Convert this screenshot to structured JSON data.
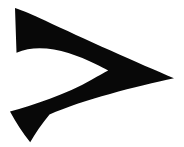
{
  "canvas": {
    "width": 184,
    "height": 147,
    "background_color": "#ffffff"
  },
  "figure": {
    "name": "chevron-right-glyph",
    "semantic": "greater-than-sign",
    "fill_color": "#080808",
    "stroke_color": "none",
    "view_box": "0 0 184 147",
    "path": "M 15.0 8.0 L 16.5 52.8 C 41.0 42.0 72.0 52.5 95.5 64.0 C 100.5 66.4 104.8 68.6 108.2 70.4 C 104.0 72.6 98.6 75.6 92.0 79.4 C 66.0 94.4 33.0 105.0 10.0 111.5 C 16.0 122.5 23.0 133.5 30.2 142.2 C 35.0 134.0 41.6 124.0 49.5 114.5 C 82.0 100.0 137.0 86.0 174.0 78.2 C 140.0 64.0 82.0 38.0 45.0 20.5 C 33.0 14.8 22.5 10.4 15.0 8.0 Z",
    "vertices": [
      {
        "label": "top-left-corner",
        "x": 15,
        "y": 8
      },
      {
        "label": "left-lower-corner",
        "x": 17,
        "y": 53
      },
      {
        "label": "inner-notch-apex",
        "x": 108,
        "y": 70
      },
      {
        "label": "bottom-left-corner",
        "x": 10,
        "y": 112
      },
      {
        "label": "bottom-point",
        "x": 30,
        "y": 142
      },
      {
        "label": "right-tip",
        "x": 174,
        "y": 78
      }
    ]
  }
}
